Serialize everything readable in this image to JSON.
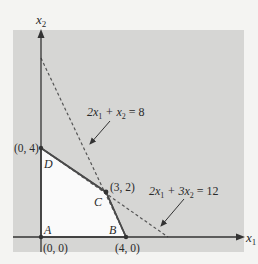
{
  "figure": {
    "type": "linear-programming-feasible-region",
    "axes": {
      "x_label": "x",
      "x_sub": "1",
      "y_label": "x",
      "y_sub": "2"
    },
    "constraints": [
      {
        "id": "c1",
        "equation": "2x1 + x2 = 8",
        "parts": {
          "a": "2x",
          "a_sub": "1",
          "op": " + x",
          "b_sub": "2",
          "rhs": " = 8"
        }
      },
      {
        "id": "c2",
        "equation": "2x1 + 3x2 = 12",
        "parts": {
          "a": "2x",
          "a_sub": "1",
          "op": " + 3x",
          "b_sub": "2",
          "rhs": " = 12"
        }
      }
    ],
    "vertices": [
      {
        "name": "A",
        "coords": "(0, 0)"
      },
      {
        "name": "B",
        "coords": "(4, 0)"
      },
      {
        "name": "C",
        "coords": "(3, 2)"
      },
      {
        "name": "D",
        "coords": "(0, 4)"
      }
    ],
    "colors": {
      "infeasible_shade": "#d6d6d4",
      "feasible_fill": "#fafafa",
      "line": "#4a4a4a",
      "page": "#f4f4f2"
    }
  }
}
